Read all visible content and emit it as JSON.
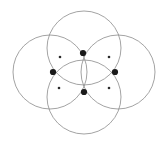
{
  "figure": {
    "kind": "geometric-diagram",
    "canvas": {
      "width": 166,
      "height": 145
    },
    "background_color": "#ffffff",
    "stroke_color": "#8c8c8c",
    "stroke_width": 0.8,
    "major_point_color": "#1a1a1a",
    "minor_point_color": "#2b2b2b"
  },
  "chart_data": {
    "type": "scatter",
    "title": "",
    "subtitle": "",
    "xlabel": "",
    "ylabel": "",
    "grid": false,
    "legend": "none",
    "xlim": [
      0,
      166
    ],
    "ylim": [
      0,
      145
    ],
    "circles": [
      {
        "name": "top-circle",
        "cx": 84,
        "cy": 48,
        "r": 37
      },
      {
        "name": "left-circle",
        "cx": 50,
        "cy": 72,
        "r": 37
      },
      {
        "name": "right-circle",
        "cx": 118,
        "cy": 72,
        "r": 37
      },
      {
        "name": "bottom-circle",
        "cx": 84,
        "cy": 97,
        "r": 37
      }
    ],
    "major_points": [
      {
        "name": "top-node",
        "x": 83,
        "y": 53,
        "r": 3.1
      },
      {
        "name": "left-node",
        "x": 53,
        "y": 72,
        "r": 3.1
      },
      {
        "name": "right-node",
        "x": 115,
        "y": 72,
        "r": 3.1
      },
      {
        "name": "bottom-node",
        "x": 84,
        "y": 92,
        "r": 3.1
      }
    ],
    "minor_points": [
      {
        "name": "upper-left-node",
        "x": 60,
        "y": 57,
        "r": 1.3
      },
      {
        "name": "upper-right-node",
        "x": 109,
        "y": 57,
        "r": 1.3
      },
      {
        "name": "lower-left-node",
        "x": 59,
        "y": 88,
        "r": 1.3
      },
      {
        "name": "lower-right-node",
        "x": 109,
        "y": 88,
        "r": 1.3
      }
    ]
  }
}
